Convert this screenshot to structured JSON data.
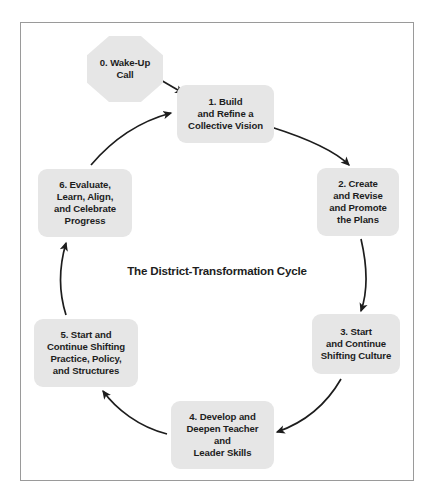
{
  "figure": {
    "center_title": "The District-Transformation Cycle",
    "border_color": "#9a9a9a",
    "node_fill": "#e6e6e6",
    "text_color": "#1d1d1d",
    "arrow_color": "#1d1d1d",
    "background": "#ffffff"
  },
  "nodes": [
    {
      "id": "wake-up-call",
      "number": "0.",
      "label": "0. Wake-Up\nCall",
      "shape": "octagon",
      "x": 66,
      "y": 13,
      "w": 76,
      "h": 66
    },
    {
      "id": "build-refine-vision",
      "number": "1.",
      "label": "1. Build\nand Refine a\nCollective Vision",
      "shape": "rounded-rect",
      "x": 156,
      "y": 62,
      "w": 97,
      "h": 58
    },
    {
      "id": "create-revise-promote-plans",
      "number": "2.",
      "label": "2. Create\nand Revise\nand Promote\nthe Plans",
      "shape": "rounded-rect",
      "x": 296,
      "y": 145,
      "w": 82,
      "h": 68
    },
    {
      "id": "shifting-culture",
      "number": "3.",
      "label": "3. Start\nand Continue\nShifting Culture",
      "shape": "rounded-rect",
      "x": 291,
      "y": 291,
      "w": 88,
      "h": 60
    },
    {
      "id": "develop-deepen-skills",
      "number": "4.",
      "label": "4. Develop and\nDeepen Teacher\nand\nLeader Skills",
      "shape": "rounded-rect",
      "x": 150,
      "y": 378,
      "w": 103,
      "h": 68
    },
    {
      "id": "shifting-practice-policy-structures",
      "number": "5.",
      "label": "5. Start and\nContinue Shifting\nPractice, Policy,\nand Structures",
      "shape": "rounded-rect",
      "x": 13,
      "y": 296,
      "w": 104,
      "h": 68
    },
    {
      "id": "evaluate-learn-align-celebrate",
      "number": "6.",
      "label": "6. Evaluate,\nLearn, Align,\nand Celebrate\nProgress",
      "shape": "rounded-rect",
      "x": 17,
      "y": 146,
      "w": 94,
      "h": 68
    }
  ],
  "arrows": [
    {
      "id": "arrow-0-to-1",
      "from": "wake-up-call",
      "to": "build-refine-vision"
    },
    {
      "id": "arrow-1-to-2",
      "from": "build-refine-vision",
      "to": "create-revise-promote-plans"
    },
    {
      "id": "arrow-2-to-3",
      "from": "create-revise-promote-plans",
      "to": "shifting-culture"
    },
    {
      "id": "arrow-3-to-4",
      "from": "shifting-culture",
      "to": "develop-deepen-skills"
    },
    {
      "id": "arrow-4-to-5",
      "from": "develop-deepen-skills",
      "to": "shifting-practice-policy-structures"
    },
    {
      "id": "arrow-5-to-6",
      "from": "shifting-practice-policy-structures",
      "to": "evaluate-learn-align-celebrate"
    },
    {
      "id": "arrow-6-to-1",
      "from": "evaluate-learn-align-celebrate",
      "to": "build-refine-vision"
    }
  ]
}
